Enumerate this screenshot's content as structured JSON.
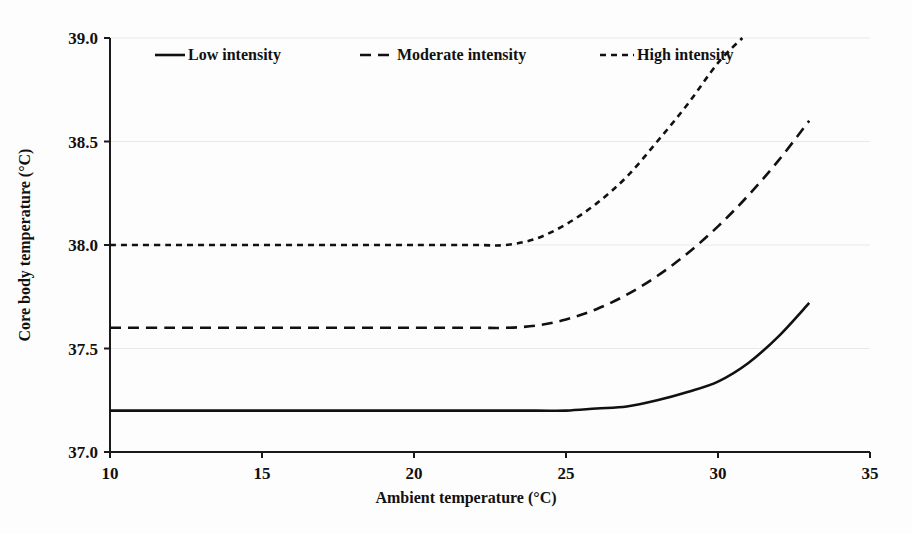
{
  "chart_data": {
    "type": "line",
    "title": "",
    "xlabel": "Ambient temperature (°C)",
    "ylabel": "Core body temperature (°C)",
    "xlim": [
      10,
      35
    ],
    "ylim": [
      37.0,
      39.0
    ],
    "xticks": [
      "10",
      "15",
      "20",
      "25",
      "30",
      "35"
    ],
    "xtick_values": [
      10,
      15,
      20,
      25,
      30,
      35
    ],
    "yticks": [
      "37.0",
      "37.5",
      "38.0",
      "38.5",
      "39.0"
    ],
    "ytick_values": [
      37.0,
      37.5,
      38.0,
      38.5,
      39.0
    ],
    "grid": "horizontal",
    "legend_position": "top-inside",
    "series": [
      {
        "name": "Low intensity",
        "line_style": "solid",
        "color": "#111111",
        "plateau_value": 37.2,
        "breakpoint_x": 27.0,
        "x": [
          10,
          12,
          14,
          16,
          18,
          20,
          22,
          24,
          25,
          26,
          27,
          28,
          29,
          30,
          31,
          32,
          33
        ],
        "y": [
          37.2,
          37.2,
          37.2,
          37.2,
          37.2,
          37.2,
          37.2,
          37.2,
          37.2,
          37.21,
          37.22,
          37.25,
          37.29,
          37.34,
          37.43,
          37.56,
          37.72
        ]
      },
      {
        "name": "Moderate intensity",
        "line_style": "dashed",
        "color": "#111111",
        "plateau_value": 37.6,
        "breakpoint_x": 24.5,
        "x": [
          10,
          12,
          14,
          16,
          18,
          20,
          22,
          23,
          24,
          25,
          26,
          27,
          28,
          29,
          30,
          31,
          32,
          33
        ],
        "y": [
          37.6,
          37.6,
          37.6,
          37.6,
          37.6,
          37.6,
          37.6,
          37.6,
          37.61,
          37.64,
          37.69,
          37.76,
          37.85,
          37.96,
          38.09,
          38.24,
          38.41,
          38.6
        ]
      },
      {
        "name": "High intensity",
        "line_style": "dotted",
        "color": "#111111",
        "plateau_value": 38.0,
        "breakpoint_x": 23.4,
        "x": [
          10,
          12,
          14,
          16,
          18,
          20,
          22,
          23,
          24,
          25,
          26,
          27,
          28,
          29,
          30,
          30.8
        ],
        "y": [
          38.0,
          38.0,
          38.0,
          38.0,
          38.0,
          38.0,
          38.0,
          38.0,
          38.03,
          38.1,
          38.2,
          38.33,
          38.5,
          38.68,
          38.88,
          39.0
        ]
      }
    ]
  },
  "legend": {
    "items": [
      {
        "label": "Low intensity",
        "style": "solid"
      },
      {
        "label": "Moderate intensity",
        "style": "dashed"
      },
      {
        "label": "High intensity",
        "style": "dotted"
      }
    ]
  },
  "colors": {
    "ink": "#111111",
    "grid": "#e9e9e9",
    "background": "#ffffff"
  }
}
